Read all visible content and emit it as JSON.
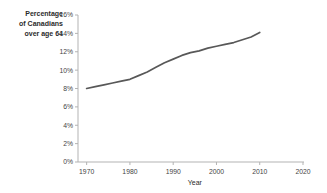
{
  "chart_data": {
    "type": "line",
    "title": "",
    "ylabel": "Percentage of Canadians over age 64",
    "ylabel_lines": [
      "Percentage",
      "of Canadians",
      "over age 64"
    ],
    "xlabel": "Year",
    "x": [
      1970,
      1972,
      1974,
      1976,
      1978,
      1980,
      1982,
      1984,
      1986,
      1988,
      1990,
      1992,
      1994,
      1996,
      1998,
      2000,
      2002,
      2004,
      2006,
      2008,
      2010
    ],
    "y": [
      8.0,
      8.2,
      8.4,
      8.6,
      8.8,
      9.0,
      9.4,
      9.8,
      10.3,
      10.8,
      11.2,
      11.6,
      11.9,
      12.1,
      12.4,
      12.6,
      12.8,
      13.0,
      13.3,
      13.6,
      14.1
    ],
    "xlim": [
      1968,
      2020
    ],
    "ylim": [
      0,
      16
    ],
    "xticks": [
      1970,
      1980,
      1990,
      2000,
      2010,
      2020
    ],
    "xtick_labels": [
      "1970",
      "1980",
      "1990",
      "2000",
      "2010",
      "2020"
    ],
    "yticks": [
      0,
      2,
      4,
      6,
      8,
      10,
      12,
      14,
      16
    ],
    "ytick_labels": [
      "0%",
      "2%",
      "4%",
      "6%",
      "8%",
      "10%",
      "12%",
      "14%",
      "16%"
    ],
    "grid": "off",
    "legend": "none",
    "line_color": "#585858",
    "axis_color": "#b3b3b3",
    "tick_label_color": "#444444"
  }
}
